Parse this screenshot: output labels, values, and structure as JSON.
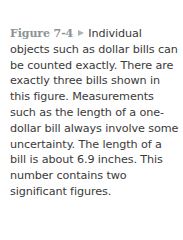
{
  "caption": {
    "figure_label": "Figure 7-4",
    "marker_icon": "triangle-right-icon",
    "text": "Individual objects such as dollar bills can be counted exactly. There are exactly three bills shown in this figure. Measurements such as the length of a one-dollar bill always involve some uncertainty. The length of a bill is about 6.9 inches. This number contains two significant figures."
  },
  "colors": {
    "label": "#8a9496",
    "marker": "#a9b3b5",
    "body_text": "#3a3a3a"
  }
}
